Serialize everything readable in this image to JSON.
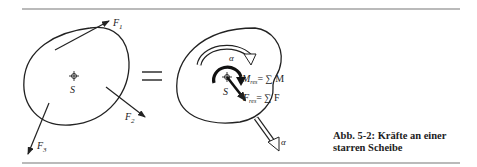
{
  "figure": {
    "caption_line1": "Abb. 5-2:  Kräfte an einer",
    "caption_line2": "starren Scheibe",
    "equals_sign": "="
  },
  "left_body": {
    "centroid_label": "S",
    "forces": [
      {
        "label": "F",
        "sub": "1"
      },
      {
        "label": "F",
        "sub": "2"
      },
      {
        "label": "F",
        "sub": "3"
      }
    ]
  },
  "right_body": {
    "centroid_label": "S",
    "alpha_top": "α",
    "alpha_bottom": "α",
    "moment_eq": {
      "lhs": "M",
      "lhs_sub": "res",
      "rhs": "= ∑ M"
    },
    "force_eq": {
      "lhs": "F",
      "lhs_sub": "res",
      "rhs": "= ∑ F"
    }
  },
  "colors": {
    "ink": "#222222",
    "rule": "#666666"
  }
}
